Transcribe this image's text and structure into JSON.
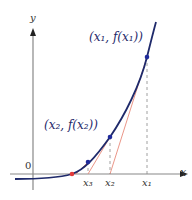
{
  "diagram": {
    "axes": {
      "x_label": "x",
      "y_label": "y",
      "origin_label": "0"
    },
    "points": [
      {
        "label": "(x₁, f(x₁))",
        "x_tick": "x₁"
      },
      {
        "label": "(x₂, f(x₂))",
        "x_tick": "x₂"
      },
      {
        "label": "",
        "x_tick": "x₃"
      }
    ],
    "colors": {
      "curve": "#1f2a6b",
      "tangent": "#e88a7a",
      "root_point": "#e23a3a",
      "point": "#1f2a9b",
      "axis": "#777777"
    }
  }
}
